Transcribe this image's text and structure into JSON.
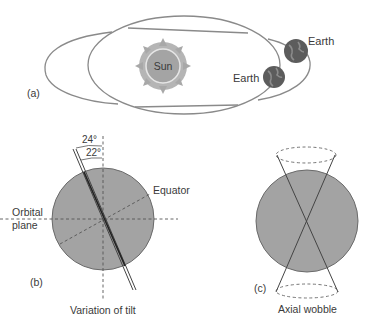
{
  "panel_a": {
    "tag": "(a)",
    "sun_label": "Sun",
    "earth_labels": [
      "Earth",
      "Earth"
    ]
  },
  "panel_b": {
    "tag": "(b)",
    "angle_outer": "24°",
    "angle_inner": "22°",
    "equator_label": "Equator",
    "orbital_plane_line1": "Orbital",
    "orbital_plane_line2": "plane",
    "caption": "Variation of tilt"
  },
  "panel_c": {
    "tag": "(c)",
    "caption": "Axial wobble"
  },
  "colors": {
    "line": "#7a7a7a",
    "globe_fill": "#a3a3a3",
    "earth_fill": "#5e5e5e",
    "sun_fill": "#9c9c9c"
  }
}
